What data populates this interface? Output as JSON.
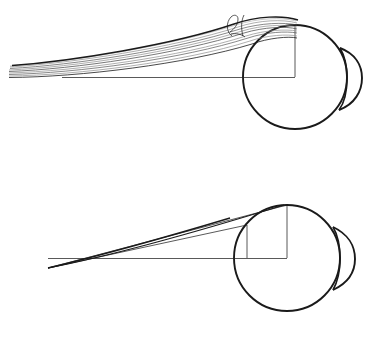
{
  "figure": {
    "title": "Ray bundle focusing onto a spherical surface",
    "background_color": "#ffffff",
    "ink_color": "#1a1a1a",
    "ray_bundle_color": "#8d8d8d",
    "width": 371,
    "height": 341,
    "panel_count": 2
  },
  "panels": [
    {
      "id": "top",
      "label": "",
      "description": "Thick aberrated ray bundle with caustic curl meeting circle at top-right",
      "origin_y": 0,
      "circle": {
        "name": "eye-sphere",
        "cx": 295,
        "cy": 77,
        "r": 52,
        "stroke": "#1a1a1a",
        "stroke_width": 1.9
      },
      "crescent": {
        "name": "lens-crescent",
        "stroke": "#1a1a1a",
        "stroke_width": 1.9,
        "outer_extent_x": 362
      },
      "vertical_radius": {
        "x": 295,
        "y_top": 24,
        "y_bottom": 77
      },
      "horizontal_axis": {
        "x_left": 62,
        "x_right": 295,
        "y": 77
      },
      "ray_bundle": {
        "line_count": 9,
        "tip_x": 8,
        "tip_y": 72,
        "contact_x": 258,
        "contact_y": 30,
        "stroke_width": 0.7
      },
      "curl": {
        "name": "caustic-curl",
        "cx": 238,
        "cy": 22,
        "size": 18
      }
    },
    {
      "id": "bottom",
      "label": "",
      "description": "Thin converging rays forming sharp focus, circle with inscribed square",
      "origin_y": 170,
      "circle": {
        "name": "eye-sphere",
        "cx": 287,
        "cy": 88,
        "r": 53,
        "stroke": "#1a1a1a",
        "stroke_width": 1.9
      },
      "crescent": {
        "name": "lens-crescent",
        "stroke": "#1a1a1a",
        "stroke_width": 1.9,
        "outer_extent_x": 355
      },
      "vertical_radius": {
        "x": 287,
        "y_top": 35,
        "y_bottom": 88
      },
      "inner_vertical": {
        "x": 247,
        "y_top": 55,
        "y_bottom": 88
      },
      "horizontal_axis": {
        "x_left": 48,
        "x_right": 287,
        "y": 88
      },
      "apex": {
        "x": 48,
        "y": 98
      },
      "rays": [
        {
          "name": "upper-ray",
          "x1": 48,
          "y1": 98,
          "x2": 287,
          "y2": 35
        },
        {
          "name": "lower-ray",
          "x1": 48,
          "y1": 98,
          "x2": 247,
          "y2": 55
        }
      ]
    }
  ],
  "chart_data": {
    "type": "diagram",
    "title": "Ray bundle focusing onto a spherical surface",
    "xlabel": "",
    "ylabel": "",
    "annotations": []
  }
}
